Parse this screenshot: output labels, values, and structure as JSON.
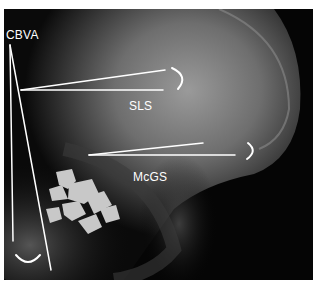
{
  "figure": {
    "labels": {
      "cbva": "CBVA",
      "sls": "SLS",
      "mcgs": "McGS"
    },
    "annotation_color": "#ffffff",
    "background_color": "#000000",
    "border_color": "#ffffff"
  }
}
